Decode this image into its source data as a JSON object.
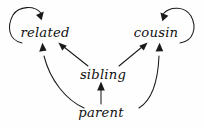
{
  "diagram": {
    "background_color": "#fefefe",
    "ink_color": "#1a1a1a",
    "width": 204,
    "height": 128,
    "nodes": [
      {
        "id": "related",
        "label": "related",
        "x": 45,
        "y": 33
      },
      {
        "id": "cousin",
        "label": "cousin",
        "x": 156,
        "y": 33
      },
      {
        "id": "sibling",
        "label": "sibling",
        "x": 103,
        "y": 75
      },
      {
        "id": "parent",
        "label": "parent",
        "x": 101,
        "y": 113
      }
    ],
    "edges": [
      {
        "id": "related-self",
        "from": "related",
        "to": "related",
        "kind": "self-loop"
      },
      {
        "id": "cousin-self",
        "from": "cousin",
        "to": "cousin",
        "kind": "self-loop"
      },
      {
        "id": "sibling-related",
        "from": "sibling",
        "to": "related",
        "kind": "straight"
      },
      {
        "id": "sibling-cousin",
        "from": "sibling",
        "to": "cousin",
        "kind": "straight"
      },
      {
        "id": "parent-sibling",
        "from": "parent",
        "to": "sibling",
        "kind": "straight"
      },
      {
        "id": "parent-related",
        "from": "parent",
        "to": "related",
        "kind": "curve"
      },
      {
        "id": "parent-cousin",
        "from": "parent",
        "to": "cousin",
        "kind": "curve"
      }
    ]
  }
}
